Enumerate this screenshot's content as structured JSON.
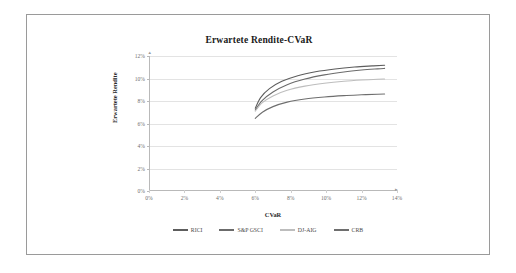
{
  "chart_data": {
    "type": "line",
    "title": "Erwartete Rendite-CVaR",
    "xlabel": "CVaR",
    "ylabel": "Erwartete Rendite",
    "xlim": [
      0,
      14
    ],
    "ylim": [
      0,
      12
    ],
    "xticks": [
      "0%",
      "2%",
      "4%",
      "6%",
      "8%",
      "10%",
      "12%",
      "14%"
    ],
    "xtick_values": [
      0,
      2,
      4,
      6,
      8,
      10,
      12,
      14
    ],
    "yticks": [
      "0%",
      "2%",
      "4%",
      "6%",
      "8%",
      "10%",
      "12%"
    ],
    "ytick_values": [
      0,
      2,
      4,
      6,
      8,
      10,
      12
    ],
    "grid": "horizontal",
    "legend_position": "bottom",
    "series": [
      {
        "name": "RICI",
        "color": "#5d5d5d",
        "x": [
          6.0,
          6.3,
          6.8,
          7.5,
          8.4,
          9.4,
          10.5,
          11.6,
          12.6,
          13.3
        ],
        "y": [
          7.35,
          8.3,
          9.1,
          9.75,
          10.25,
          10.6,
          10.85,
          11.02,
          11.12,
          11.18
        ]
      },
      {
        "name": "S&P GSCI",
        "color": "#6b6b6b",
        "x": [
          6.0,
          6.4,
          7.0,
          7.8,
          8.8,
          9.9,
          11.0,
          12.0,
          12.9,
          13.3
        ],
        "y": [
          7.2,
          8.05,
          8.8,
          9.45,
          9.95,
          10.32,
          10.58,
          10.75,
          10.86,
          10.9
        ]
      },
      {
        "name": "DJ-AIG",
        "color": "#bdbdbd",
        "x": [
          6.0,
          6.4,
          7.0,
          7.8,
          8.8,
          9.9,
          11.0,
          12.0,
          12.9,
          13.3
        ],
        "y": [
          7.1,
          7.85,
          8.45,
          8.95,
          9.32,
          9.58,
          9.76,
          9.87,
          9.94,
          9.96
        ]
      },
      {
        "name": "CRB",
        "color": "#6e6e6e",
        "x": [
          6.0,
          6.4,
          7.0,
          7.8,
          8.8,
          9.9,
          11.0,
          12.0,
          12.9,
          13.3
        ],
        "y": [
          6.45,
          7.0,
          7.5,
          7.9,
          8.18,
          8.36,
          8.48,
          8.55,
          8.6,
          8.62
        ]
      }
    ]
  },
  "axis_arrow": "▸"
}
